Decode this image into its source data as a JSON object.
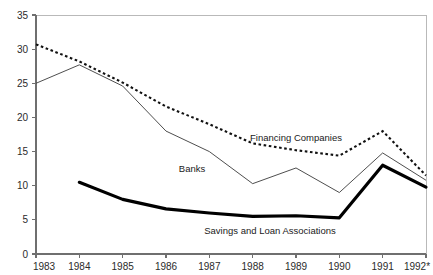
{
  "chart_data": {
    "type": "line",
    "title": "",
    "subtitle": "",
    "xlabel": "",
    "ylabel": "",
    "x": [
      "1983",
      "1984",
      "1985",
      "1986",
      "1987",
      "1988",
      "1989",
      "1990",
      "1991",
      "1992*"
    ],
    "categories": [
      "1983",
      "1984",
      "1985",
      "1986",
      "1987",
      "1988",
      "1989",
      "1990",
      "1991",
      "1992*"
    ],
    "xlim": [
      "1983",
      "1992*"
    ],
    "ylim": [
      0,
      35
    ],
    "yticks": [
      0,
      5,
      10,
      15,
      20,
      25,
      30,
      35
    ],
    "ytick_labels": [
      "0",
      "5",
      "10",
      "15",
      "20",
      "25",
      "30",
      "35"
    ],
    "xtick_labels": [
      "1983",
      "1984",
      "1985",
      "1986",
      "1987",
      "1988",
      "1989",
      "1990",
      "1991",
      "1992*"
    ],
    "grid": false,
    "legend_position": "inline-annotations",
    "series": [
      {
        "name": "Financing Companies",
        "style": "dotted",
        "color": "#111111",
        "x": [
          "1983",
          "1984",
          "1985",
          "1986",
          "1987",
          "1988",
          "1989",
          "1990",
          "1991",
          "1992*"
        ],
        "values": [
          30.7,
          28.2,
          25.1,
          21.6,
          19.0,
          16.2,
          15.2,
          14.4,
          18.0,
          11.5
        ]
      },
      {
        "name": "Banks",
        "style": "solid-thin",
        "color": "#454545",
        "x": [
          "1983",
          "1984",
          "1985",
          "1986",
          "1987",
          "1988",
          "1989",
          "1990",
          "1991",
          "1992*"
        ],
        "values": [
          25.0,
          27.7,
          24.6,
          18.0,
          15.0,
          10.3,
          12.6,
          9.0,
          14.8,
          10.8
        ]
      },
      {
        "name": "Savings and Loan Associations",
        "style": "solid-thick",
        "color": "#000000",
        "x": [
          "1984",
          "1985",
          "1986",
          "1987",
          "1988",
          "1989",
          "1990",
          "1991",
          "1992*"
        ],
        "values": [
          10.5,
          8.0,
          6.6,
          6.0,
          5.5,
          5.6,
          5.3,
          13.0,
          9.8
        ]
      }
    ],
    "annotations": [
      {
        "text": "Financing Companies",
        "x": "1989",
        "y": 16.6
      },
      {
        "text": "Banks",
        "x": "1986.6",
        "y": 12.0
      },
      {
        "text": "Savings and Loan Associations",
        "x": "1988.4",
        "y": 3.0
      }
    ]
  }
}
